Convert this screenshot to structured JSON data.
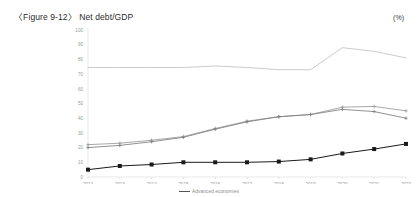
{
  "figure": {
    "title": "〈Figure 9-12〉 Net debt/GDP",
    "unit": "(%)"
  },
  "legend": {
    "items": [
      {
        "label": "Advanced economies",
        "color": "#555555"
      }
    ]
  },
  "chart_data": {
    "type": "line",
    "title": "〈Figure 9-12〉 Net debt/GDP",
    "xlabel": "",
    "ylabel": "",
    "unit": "(%)",
    "grid": false,
    "legend_position": "bottom-center",
    "ylim": [
      0,
      100
    ],
    "yticks": [
      0,
      10,
      20,
      30,
      40,
      50,
      60,
      70,
      80,
      90,
      100
    ],
    "categories": [
      "2012",
      "2013",
      "2014",
      "2015",
      "2016",
      "2017",
      "2018",
      "2019",
      "2020",
      "2021",
      "2022"
    ],
    "series": [
      {
        "name": "Advanced economies",
        "color": "#b9b9b9",
        "marker": "none",
        "values": [
          74.5,
          74.5,
          74.5,
          74.5,
          75.5,
          74.5,
          73.0,
          73.0,
          88.0,
          85.5,
          81.0
        ]
      },
      {
        "name": "series-2",
        "color": "#9a9a9a",
        "marker": "cross",
        "values": [
          22.0,
          23.0,
          25.0,
          27.5,
          33.0,
          38.0,
          41.0,
          42.5,
          47.5,
          48.0,
          45.0
        ]
      },
      {
        "name": "series-3",
        "color": "#7d7d7d",
        "marker": "cross",
        "values": [
          20.0,
          21.5,
          24.0,
          27.0,
          32.5,
          37.5,
          41.0,
          42.5,
          46.0,
          44.5,
          40.0
        ]
      },
      {
        "name": "series-4",
        "color": "#1a1a1a",
        "marker": "square",
        "values": [
          5.0,
          7.5,
          8.5,
          10.0,
          10.0,
          10.0,
          10.5,
          12.0,
          16.0,
          19.0,
          22.5
        ]
      }
    ]
  }
}
